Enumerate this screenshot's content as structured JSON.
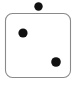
{
  "figure": {
    "name": "dice-like-dot-diagram",
    "canvas": {
      "width": 78,
      "height": 85,
      "background_color": "#ffffff"
    },
    "shapes": {
      "rounded_rectangle": {
        "label": "rounded-rectangle",
        "x": 5.5,
        "y": 13.5,
        "width": 65,
        "height": 64,
        "corner_radius": 7,
        "fill_color": "#ffffff",
        "stroke_color": "#8a8a8a",
        "stroke_width": 1.1
      },
      "dots": [
        {
          "label": "dot-outside-top",
          "position": "above-rectangle",
          "cx": 38.5,
          "cy": 6.5,
          "r": 4.2,
          "fill_color": "#111111"
        },
        {
          "label": "dot-upper-left",
          "position": "inside-upper-left",
          "cx": 23,
          "cy": 33,
          "r": 4.6,
          "fill_color": "#111111"
        },
        {
          "label": "dot-lower-right",
          "position": "inside-lower-right",
          "cx": 56,
          "cy": 62,
          "r": 4.8,
          "fill_color": "#111111"
        }
      ]
    },
    "counts": {
      "dots_total": 3,
      "dots_inside": 2,
      "dots_outside": 1
    }
  }
}
